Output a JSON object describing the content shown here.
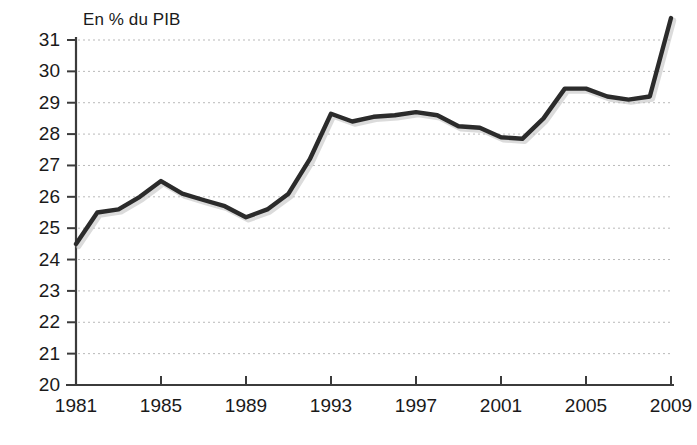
{
  "chart_data": {
    "type": "line",
    "title": "",
    "ylabel": "En % du PIB",
    "xlabel": "",
    "ylim": [
      20,
      31.2
    ],
    "xlim": [
      1981,
      2009.1
    ],
    "grid": "horizontal-dotted",
    "legend": "none",
    "line_color": "#2b2b2b",
    "y_ticks": [
      31,
      30,
      29,
      28,
      27,
      26,
      25,
      24,
      23,
      22,
      21,
      20
    ],
    "y_tick_labels": [
      "31",
      "30",
      "29",
      "28",
      "27",
      "26",
      "25",
      "24",
      "23",
      "22",
      "21",
      "20"
    ],
    "x_ticks": [
      1981,
      1985,
      1989,
      1993,
      1997,
      2001,
      2005,
      2009
    ],
    "x_tick_labels": [
      "1981",
      "1985",
      "1989",
      "1993",
      "1997",
      "2001",
      "2005",
      "2009"
    ],
    "x": [
      1981,
      1982,
      1983,
      1984,
      1985,
      1986,
      1987,
      1988,
      1989,
      1990,
      1991,
      1992,
      1993,
      1994,
      1995,
      1996,
      1997,
      1998,
      1999,
      2000,
      2001,
      2002,
      2003,
      2004,
      2005,
      2006,
      2007,
      2008,
      2009
    ],
    "values": [
      24.5,
      25.5,
      25.6,
      26.0,
      26.5,
      26.1,
      25.9,
      25.7,
      25.35,
      25.6,
      26.1,
      27.2,
      28.65,
      28.4,
      28.55,
      28.6,
      28.7,
      28.6,
      28.25,
      28.2,
      27.9,
      27.85,
      28.5,
      29.45,
      29.45,
      29.2,
      29.1,
      29.2,
      31.7
    ]
  }
}
